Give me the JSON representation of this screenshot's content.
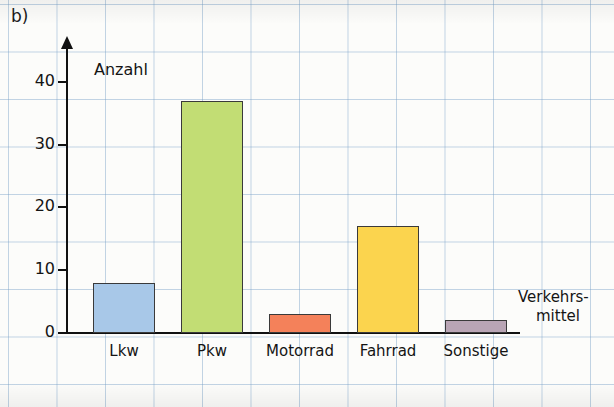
{
  "figure": {
    "panel_label": "b)"
  },
  "chart_data": {
    "type": "bar",
    "title": "",
    "categories": [
      "Lkw",
      "Pkw",
      "Motorrad",
      "Fahrrad",
      "Sonstige"
    ],
    "values": [
      8,
      37,
      3,
      17,
      2
    ],
    "colors": [
      "#a8c8e8",
      "#c2dd74",
      "#f4815a",
      "#fbd44e",
      "#b9a5b5"
    ],
    "xlabel_line1": "Verkehrs-",
    "xlabel_line2": "mittel",
    "ylabel": "Anzahl",
    "ylim": [
      0,
      45
    ],
    "yticks": [
      0,
      10,
      20,
      30,
      40
    ],
    "ytick_labels": [
      "0",
      "10",
      "20",
      "30",
      "40"
    ],
    "grid": true,
    "legend": "none"
  }
}
